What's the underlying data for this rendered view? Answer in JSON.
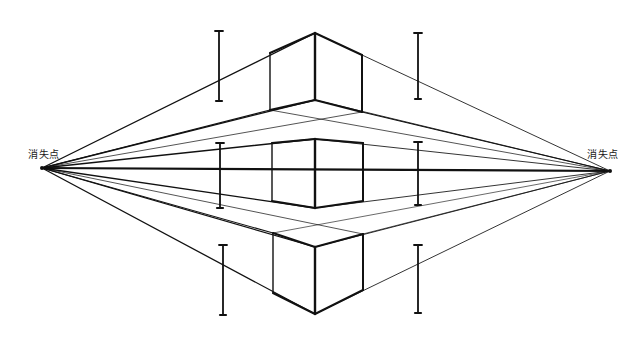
{
  "diagram": {
    "vanishing_point_label_left": "消失点",
    "vanishing_point_label_right": "消失点",
    "ink_color": "#111111",
    "paper_color": "#ffffff",
    "cubes": [
      {
        "name": "cube-above-horizon",
        "position": "above"
      },
      {
        "name": "cube-on-horizon",
        "position": "on"
      },
      {
        "name": "cube-below-horizon",
        "position": "below"
      }
    ],
    "measurement_bars_count": 6
  }
}
